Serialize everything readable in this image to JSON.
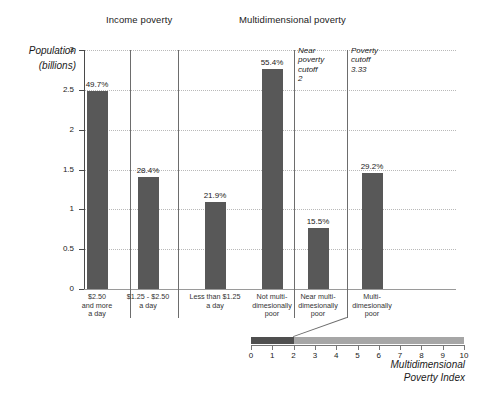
{
  "chart_data": {
    "type": "bar",
    "title": "",
    "ylabel": "Population (billions)",
    "ylim": [
      0,
      3
    ],
    "yticks": [
      "0",
      "0.5",
      "1",
      "1.5",
      "2",
      "2.5",
      "3"
    ],
    "ytick_values": [
      0,
      0.5,
      1,
      1.5,
      2,
      2.5,
      3
    ],
    "grid": true,
    "xlabel": "",
    "groups": [
      {
        "name": "Income poverty",
        "categories": [
          "$2.50\nand more\na day",
          "$1.25 - $2.50\na day",
          "Less than $1.25\na day"
        ],
        "values": [
          2.48,
          1.41,
          1.09
        ],
        "labels": [
          "49.7%",
          "28.4%",
          "21.9%"
        ]
      },
      {
        "name": "Multidimensional poverty",
        "categories": [
          "Not multi-\ndimesionally\npoor",
          "Near multi-\ndimesionally\npoor",
          "Multi-\ndimesionally\npoor"
        ],
        "values": [
          2.76,
          0.77,
          1.45
        ],
        "labels": [
          "55.4%",
          "15.5%",
          "29.2%"
        ]
      }
    ],
    "annotations": [
      {
        "text": "Near\npoverty\ncutoff\n2",
        "value": 2
      },
      {
        "text": "Poverty\ncutoff\n3.33",
        "value": 3.33
      }
    ],
    "secondary_axis": {
      "title": "Multidimensional\nPoverty Index",
      "range": [
        0,
        10
      ],
      "ticks": [
        "0",
        "1",
        "2",
        "3",
        "4",
        "5",
        "6",
        "7",
        "8",
        "9",
        "10"
      ],
      "dark_segment": [
        0,
        2
      ],
      "light_segment": [
        2,
        10
      ]
    },
    "colors": {
      "bar": "#585858",
      "mpi_dark": "#4f4f4f",
      "mpi_light": "#a6a6a6",
      "axis": "#4a4a4a",
      "grid": "#b9b9b9"
    }
  }
}
